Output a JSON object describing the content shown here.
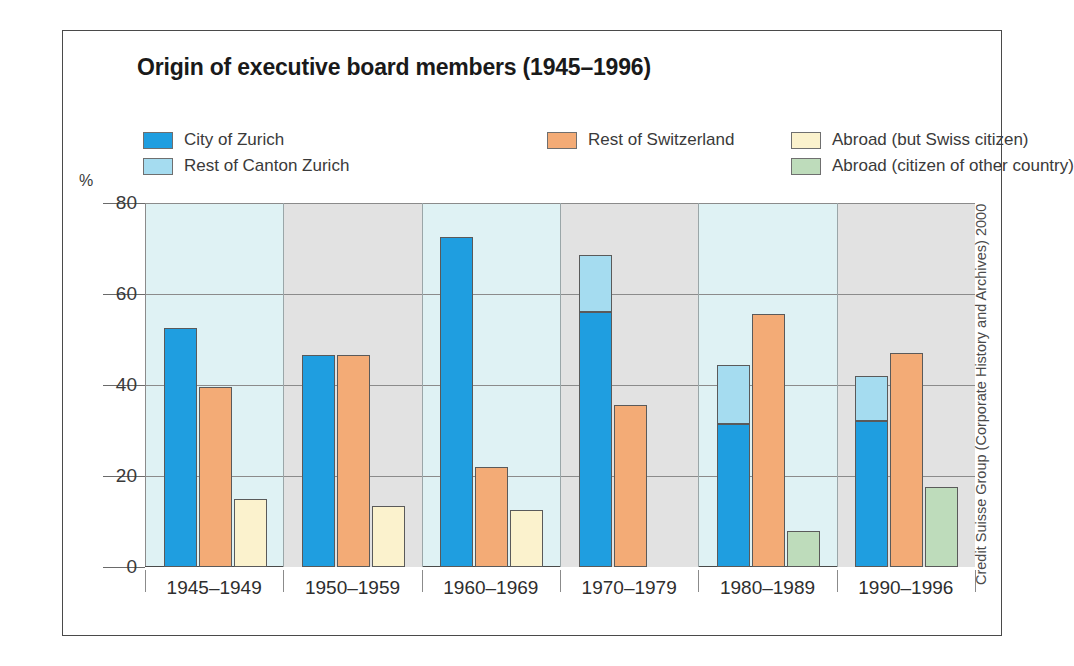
{
  "title": "Origin of executive board members (1945–1996)",
  "axis_unit": "%",
  "credit": "Credit Suisse Group (Corporate History and Archives) 2000",
  "legend": {
    "columns": [
      [
        {
          "label": "City of Zurich",
          "color": "#1f9ee0",
          "name": "city-of-zurich"
        },
        {
          "label": "Rest of Canton Zurich",
          "color": "#a5dcf0",
          "name": "rest-of-canton-zurich"
        }
      ],
      [
        {
          "label": "Rest of Switzerland",
          "color": "#f3ab76",
          "name": "rest-of-switzerland"
        }
      ],
      [
        {
          "label": "Abroad (but Swiss citizen)",
          "color": "#fbf2cd",
          "name": "abroad-swiss-citizen"
        },
        {
          "label": "Abroad (citizen of other country)",
          "color": "#bedcbb",
          "name": "abroad-other-country"
        }
      ]
    ]
  },
  "chart_data": {
    "type": "bar",
    "title": "Origin of executive board members (1945–1996)",
    "xlabel": "",
    "ylabel": "%",
    "ylim": [
      0,
      80
    ],
    "yticks": [
      0,
      20,
      40,
      60,
      80
    ],
    "grid": true,
    "legend_position": "top",
    "stacking": "City of Zurich and Rest of Canton Zurich are stacked; other series are separate bars",
    "categories": [
      "1945–1949",
      "1950–1959",
      "1960–1969",
      "1970–1979",
      "1980–1989",
      "1990–1996"
    ],
    "series": [
      {
        "name": "City of Zurich",
        "color": "#1f9ee0",
        "values": [
          52.5,
          46.5,
          72.5,
          56,
          31.5,
          32
        ]
      },
      {
        "name": "Rest of Canton Zurich",
        "color": "#a5dcf0",
        "values": [
          0,
          0,
          0,
          12.5,
          13,
          10
        ]
      },
      {
        "name": "Rest of Switzerland",
        "color": "#f3ab76",
        "values": [
          39.5,
          46.5,
          22,
          35.5,
          55.5,
          47
        ]
      },
      {
        "name": "Abroad (but Swiss citizen)",
        "color": "#fbf2cd",
        "values": [
          15,
          13.5,
          12.5,
          0,
          0,
          0
        ]
      },
      {
        "name": "Abroad (citizen of other country)",
        "color": "#bedcbb",
        "values": [
          0,
          0,
          0,
          0,
          8,
          17.5
        ]
      }
    ]
  },
  "colors": {
    "plot_background": "#dff2f4",
    "alternate_band": "#e2e2e2",
    "gridline": "#8b8b8b",
    "frame": "#4a4a4a",
    "text": "#2e2e2e"
  }
}
